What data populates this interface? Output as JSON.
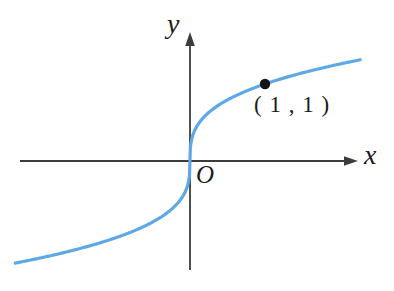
{
  "figure": {
    "background": "#ffffff"
  },
  "chart_data": {
    "type": "line",
    "title": "",
    "function": "y = x^(1/3)",
    "x_range": [
      -2.33,
      2.27
    ],
    "y_range": [
      -1.35,
      1.32
    ],
    "xlabel": "x",
    "ylabel": "y",
    "origin_label": "O",
    "grid": false,
    "axes_arrows": true,
    "legend": false,
    "curve_color": "#5fa8e6",
    "axis_color": "#3c3c3c",
    "point_color": "#141414",
    "marked_points": [
      {
        "x": 1,
        "y": 1,
        "label": "( 1 , 1 )"
      }
    ]
  }
}
